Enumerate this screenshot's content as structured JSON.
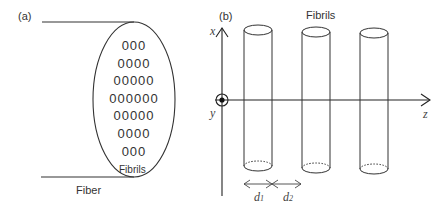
{
  "panel_a": {
    "label": "(a)",
    "fiber_label": "Fiber",
    "fibrils_label": "Fibrils",
    "fibril_rows": [
      3,
      4,
      5,
      6,
      5,
      4,
      3
    ],
    "fibril_glyph": "0"
  },
  "panel_b": {
    "label": "(b)",
    "fibrils_label": "Fibrils",
    "axes": {
      "x": "x",
      "y": "y",
      "z": "z"
    },
    "cylinder_count": 3,
    "spacings": [
      {
        "symbol": "d",
        "subscript": "1"
      },
      {
        "symbol": "d",
        "subscript": "2"
      }
    ]
  }
}
